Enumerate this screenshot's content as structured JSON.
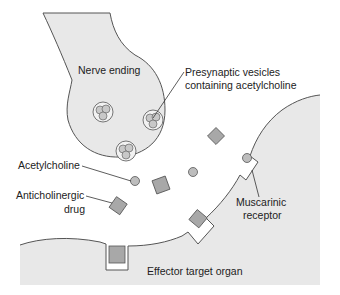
{
  "labels": {
    "nerve_ending": "Nerve ending",
    "vesicles_line1": "Presynaptic vesicles",
    "vesicles_line2": "containing acetylcholine",
    "acetylcholine": "Acetylcholine",
    "anticholinergic_line1": "Anticholinergic",
    "anticholinergic_line2": "drug",
    "muscarinic_line1": "Muscarinic",
    "muscarinic_line2": "receptor",
    "effector": "Effector target organ"
  },
  "colors": {
    "tissue_fill": "#e8e8e8",
    "molecule_fill": "#a8a8a8",
    "outline": "#555555",
    "text": "#222222"
  }
}
